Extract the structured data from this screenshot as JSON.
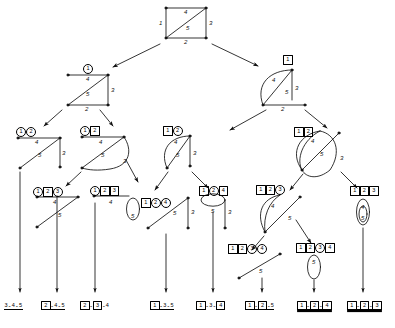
{
  "diagram": {
    "edge_labels": [
      "1",
      "2",
      "3",
      "4",
      "5"
    ],
    "legend": {
      "circled": "deleted edge",
      "boxed": "contracted edge"
    },
    "colors": {
      "stroke": "#111111",
      "text": "#000000",
      "background": "#ffffff"
    }
  },
  "nodes": [
    {
      "id": "root",
      "name": "root-square-graph",
      "tags": [],
      "shape": "square-with-diagonal",
      "edges": [
        {
          "label": "1",
          "pos": "left"
        },
        {
          "label": "2",
          "pos": "bottom"
        },
        {
          "label": "3",
          "pos": "right"
        },
        {
          "label": "4",
          "pos": "top"
        },
        {
          "label": "5",
          "pos": "diagonal"
        }
      ]
    },
    {
      "id": "n1",
      "name": "node-del1-triangle",
      "tags": [
        {
          "text": "1",
          "style": "circled"
        }
      ],
      "shape": "triangle",
      "edges": [
        {
          "label": "4",
          "pos": "top"
        },
        {
          "label": "5",
          "pos": "diagonal"
        },
        {
          "label": "3",
          "pos": "right"
        },
        {
          "label": "2",
          "pos": "bottom"
        }
      ]
    },
    {
      "id": "n2",
      "name": "node-con1-arc",
      "tags": [
        {
          "text": "1",
          "style": "boxed"
        }
      ],
      "shape": "arc-triangle",
      "edges": [
        {
          "label": "4",
          "pos": "arc"
        },
        {
          "label": "5",
          "pos": "diagonal"
        },
        {
          "label": "3",
          "pos": "right"
        },
        {
          "label": "2",
          "pos": "bottom"
        }
      ]
    },
    {
      "id": "n3",
      "name": "node-del1-del2-path",
      "tags": [
        {
          "text": "1",
          "style": "circled"
        },
        {
          "text": "2",
          "style": "circled"
        }
      ],
      "shape": "path",
      "edges": [
        {
          "label": "4",
          "pos": "top"
        },
        {
          "label": "5",
          "pos": "diagonal"
        },
        {
          "label": "3",
          "pos": "right"
        }
      ]
    },
    {
      "id": "n4",
      "name": "node-del1-con2-arc",
      "tags": [
        {
          "text": "1",
          "style": "circled"
        },
        {
          "text": "2",
          "style": "boxed"
        }
      ],
      "shape": "arc-path",
      "edges": [
        {
          "label": "4",
          "pos": "top"
        },
        {
          "label": "5",
          "pos": "diagonal"
        },
        {
          "label": "3",
          "pos": "arc"
        }
      ]
    },
    {
      "id": "n5",
      "name": "node-con1-del2-arc",
      "tags": [
        {
          "text": "1",
          "style": "boxed"
        },
        {
          "text": "2",
          "style": "circled"
        }
      ],
      "shape": "arc-path",
      "edges": [
        {
          "label": "4",
          "pos": "arc"
        },
        {
          "label": "5",
          "pos": "diagonal"
        },
        {
          "label": "3",
          "pos": "right"
        }
      ]
    },
    {
      "id": "n6",
      "name": "node-con1-con2-lens",
      "tags": [
        {
          "text": "1",
          "style": "boxed"
        },
        {
          "text": "2",
          "style": "boxed"
        }
      ],
      "shape": "lens",
      "edges": [
        {
          "label": "4",
          "pos": "arc-left"
        },
        {
          "label": "5",
          "pos": "diagonal"
        },
        {
          "label": "3",
          "pos": "arc-right"
        }
      ]
    },
    {
      "id": "n7",
      "name": "node-del1-con2-del3",
      "tags": [
        {
          "text": "1",
          "style": "circled"
        },
        {
          "text": "2",
          "style": "boxed"
        },
        {
          "text": "3",
          "style": "circled"
        }
      ],
      "shape": "path",
      "edges": [
        {
          "label": "4",
          "pos": "top"
        },
        {
          "label": "5",
          "pos": "diagonal"
        }
      ]
    },
    {
      "id": "n8",
      "name": "node-del1-con2-con3-loop",
      "tags": [
        {
          "text": "1",
          "style": "circled"
        },
        {
          "text": "2",
          "style": "boxed"
        },
        {
          "text": "3",
          "style": "boxed"
        }
      ],
      "shape": "edge-with-loop",
      "edges": [
        {
          "label": "4",
          "pos": "top"
        },
        {
          "label": "5",
          "pos": "loop"
        }
      ]
    },
    {
      "id": "n9",
      "name": "node-con1-del2-del4",
      "tags": [
        {
          "text": "1",
          "style": "boxed"
        },
        {
          "text": "2",
          "style": "circled"
        },
        {
          "text": "4",
          "style": "circled"
        }
      ],
      "shape": "path",
      "edges": [
        {
          "label": "5",
          "pos": "diagonal"
        },
        {
          "label": "3",
          "pos": "right"
        }
      ]
    },
    {
      "id": "n10",
      "name": "node-con1-del2-con4-loop",
      "tags": [
        {
          "text": "1",
          "style": "boxed"
        },
        {
          "text": "2",
          "style": "circled"
        },
        {
          "text": "4",
          "style": "boxed"
        }
      ],
      "shape": "loop-with-edge",
      "edges": [
        {
          "label": "5",
          "pos": "loop"
        },
        {
          "label": "3",
          "pos": "right"
        }
      ]
    },
    {
      "id": "n11",
      "name": "node-con1-con2-del3-arc",
      "tags": [
        {
          "text": "1",
          "style": "boxed"
        },
        {
          "text": "2",
          "style": "boxed"
        },
        {
          "text": "3",
          "style": "circled"
        }
      ],
      "shape": "arc-path",
      "edges": [
        {
          "label": "4",
          "pos": "arc"
        },
        {
          "label": "5",
          "pos": "diagonal"
        }
      ]
    },
    {
      "id": "n12",
      "name": "node-con1-con2-con3-double-loop",
      "tags": [
        {
          "text": "1",
          "style": "boxed"
        },
        {
          "text": "2",
          "style": "boxed"
        },
        {
          "text": "3",
          "style": "boxed"
        }
      ],
      "shape": "double-loop",
      "edges": [
        {
          "label": "4",
          "pos": "loop-outer"
        },
        {
          "label": "5",
          "pos": "loop-inner"
        }
      ]
    },
    {
      "id": "n13",
      "name": "node-con1-con2-del3-del4",
      "tags": [
        {
          "text": "1",
          "style": "boxed"
        },
        {
          "text": "2",
          "style": "boxed"
        },
        {
          "text": "3",
          "style": "circled"
        },
        {
          "text": "4",
          "style": "circled"
        }
      ],
      "shape": "single-edge",
      "edges": [
        {
          "label": "5",
          "pos": "diagonal"
        }
      ]
    },
    {
      "id": "n14",
      "name": "node-con1-con2-del3-con4-loop",
      "tags": [
        {
          "text": "1",
          "style": "boxed"
        },
        {
          "text": "2",
          "style": "boxed"
        },
        {
          "text": "3",
          "style": "circled"
        },
        {
          "text": "4",
          "style": "boxed"
        }
      ],
      "shape": "loop",
      "edges": [
        {
          "label": "5",
          "pos": "loop"
        }
      ]
    }
  ],
  "leaves": [
    {
      "id": "L1",
      "name": "leaf-3-4-5",
      "underline": "single",
      "tokens": [
        {
          "text": "3",
          "style": "plain"
        },
        {
          "text": "-",
          "style": "sep"
        },
        {
          "text": "4",
          "style": "plain"
        },
        {
          "text": "-",
          "style": "sep"
        },
        {
          "text": "5",
          "style": "plain"
        }
      ]
    },
    {
      "id": "L2",
      "name": "leaf-2-4-5",
      "underline": "single",
      "tokens": [
        {
          "text": "2",
          "style": "boxed"
        },
        {
          "text": "-",
          "style": "sep"
        },
        {
          "text": "4",
          "style": "plain"
        },
        {
          "text": "-",
          "style": "sep"
        },
        {
          "text": "5",
          "style": "plain"
        }
      ]
    },
    {
      "id": "L3",
      "name": "leaf-2-3-4",
      "underline": "none",
      "tokens": [
        {
          "text": "2",
          "style": "boxed"
        },
        {
          "text": "-",
          "style": "sep"
        },
        {
          "text": "3",
          "style": "boxed"
        },
        {
          "text": "-",
          "style": "sep"
        },
        {
          "text": "4",
          "style": "plain"
        }
      ]
    },
    {
      "id": "L4",
      "name": "leaf-1-3-5",
      "underline": "single",
      "tokens": [
        {
          "text": "1",
          "style": "boxed"
        },
        {
          "text": "-",
          "style": "sep"
        },
        {
          "text": "3",
          "style": "plain"
        },
        {
          "text": "-",
          "style": "sep"
        },
        {
          "text": "5",
          "style": "plain"
        }
      ]
    },
    {
      "id": "L5",
      "name": "leaf-1-3-4",
      "underline": "none",
      "tokens": [
        {
          "text": "1",
          "style": "boxed"
        },
        {
          "text": "-",
          "style": "sep"
        },
        {
          "text": "3",
          "style": "plain"
        },
        {
          "text": "-",
          "style": "sep"
        },
        {
          "text": "4",
          "style": "boxed"
        }
      ]
    },
    {
      "id": "L6",
      "name": "leaf-1-2-5",
      "underline": "single",
      "tokens": [
        {
          "text": "1",
          "style": "boxed"
        },
        {
          "text": "-",
          "style": "sep"
        },
        {
          "text": "2",
          "style": "boxed"
        },
        {
          "text": "-",
          "style": "sep"
        },
        {
          "text": "5",
          "style": "plain"
        }
      ]
    },
    {
      "id": "L7",
      "name": "leaf-1-2-4",
      "underline": "double",
      "tokens": [
        {
          "text": "1",
          "style": "boxed"
        },
        {
          "text": "-",
          "style": "sep"
        },
        {
          "text": "2",
          "style": "boxed"
        },
        {
          "text": "-",
          "style": "sep"
        },
        {
          "text": "4",
          "style": "boxed"
        }
      ]
    },
    {
      "id": "L8",
      "name": "leaf-1-2-3",
      "underline": "double",
      "tokens": [
        {
          "text": "1",
          "style": "boxed"
        },
        {
          "text": "-",
          "style": "sep"
        },
        {
          "text": "2",
          "style": "boxed"
        },
        {
          "text": "-",
          "style": "sep"
        },
        {
          "text": "3",
          "style": "boxed"
        }
      ]
    }
  ],
  "edge_label_texts": {
    "one": "1",
    "two": "2",
    "three": "3",
    "four": "4",
    "five": "5"
  }
}
